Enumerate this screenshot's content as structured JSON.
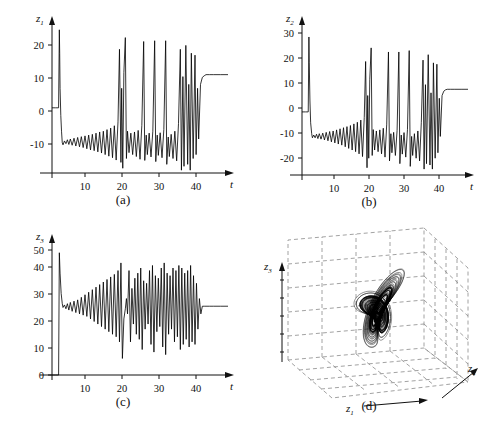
{
  "figure": {
    "background": "#ffffff",
    "line_color": "#000000",
    "grid_color": "#888888",
    "panels": [
      {
        "id": "a",
        "caption": "(a)"
      },
      {
        "id": "b",
        "caption": "(b)"
      },
      {
        "id": "c",
        "caption": "(c)"
      },
      {
        "id": "d",
        "caption": "(d)"
      }
    ]
  },
  "chart_data": [
    {
      "type": "line",
      "panel": "a",
      "title": "",
      "xlabel": "t",
      "ylabel": "z1",
      "ylabel_base": "z",
      "ylabel_sub": "1",
      "xlim": [
        0,
        48
      ],
      "ylim": [
        -18,
        22
      ],
      "xticks": [
        10,
        20,
        30,
        40
      ],
      "yticks": [
        -10,
        0,
        10,
        20
      ],
      "xtick_labels": [
        "10",
        "20",
        "30",
        "40"
      ],
      "ytick_labels": [
        "-10",
        "0",
        "10",
        "20"
      ],
      "grid": false,
      "steady_state": 8.5,
      "initial_spike": 20,
      "description": "Chaotic transient of z1 settling to fixed point 8.5 near t=42",
      "series": [
        {
          "name": "z1",
          "x": [
            0,
            1.0,
            1.8,
            2.0,
            2.1,
            2.2,
            2.4,
            2.6,
            2.8,
            3.0,
            3.4,
            3.8,
            4.2,
            4.6,
            5.0,
            5.5,
            6.0,
            6.5,
            7.0,
            7.5,
            8.0,
            8.5,
            9.0,
            9.5,
            10.0,
            10.5,
            11.0,
            11.5,
            12.0,
            12.5,
            13.0,
            13.5,
            14.0,
            14.5,
            15.0,
            15.5,
            16.0,
            16.5,
            17.0,
            17.5,
            18.0,
            18.4,
            18.8,
            19.0,
            19.3,
            19.6,
            20.0,
            20.3,
            20.6,
            21.0,
            21.5,
            22.0,
            22.5,
            23.0,
            23.5,
            24.0,
            24.5,
            25.0,
            25.3,
            25.7,
            26.0,
            26.5,
            27.0,
            27.5,
            28.0,
            28.3,
            28.7,
            29.0,
            29.5,
            30.0,
            30.5,
            31.0,
            31.3,
            31.7,
            32.0,
            32.5,
            33.0,
            33.5,
            34.0,
            34.5,
            35.0,
            35.3,
            35.7,
            36.0,
            36.5,
            37.0,
            37.3,
            37.7,
            38.0,
            38.5,
            39.0,
            39.3,
            39.7,
            40.0,
            40.5,
            41.0,
            41.5,
            42.0,
            43.0,
            44.0,
            46.0,
            48.0
          ],
          "y": [
            0,
            0,
            0,
            20,
            14,
            5,
            -2,
            -6,
            -9,
            -9.5,
            -8.5,
            -9.2,
            -8.2,
            -9.4,
            -8.0,
            -9.6,
            -7.8,
            -9.8,
            -7.6,
            -10.0,
            -7.4,
            -10.2,
            -7.2,
            -10.5,
            -7.0,
            -10.8,
            -6.8,
            -11.0,
            -6.5,
            -11.3,
            -6.2,
            -11.6,
            -6.0,
            -12.0,
            -5.6,
            -12.4,
            -5.2,
            -12.8,
            -4.6,
            -13.4,
            -3.6,
            15.0,
            -14.0,
            5.0,
            -15.5,
            9.0,
            18.0,
            -13.0,
            -6.0,
            -11.5,
            -6.5,
            -12.0,
            -6.2,
            -12.5,
            -5.8,
            -13.2,
            -4.5,
            17.0,
            -13.5,
            -7.0,
            -12.0,
            -6.5,
            -12.6,
            -6.0,
            17.2,
            -13.8,
            -7.0,
            -12.2,
            -6.4,
            -12.8,
            -5.6,
            17.2,
            -14.5,
            -7.5,
            -12.5,
            -6.8,
            -13.0,
            -6.0,
            -13.6,
            -4.0,
            15.0,
            -16.0,
            8.0,
            -15.0,
            16.0,
            -14.5,
            6.0,
            -16.0,
            14.0,
            -13.0,
            13.5,
            -12.0,
            5.0,
            -8.0,
            6.0,
            7.8,
            8.2,
            8.5,
            8.5,
            8.5,
            8.5,
            8.5
          ]
        }
      ]
    },
    {
      "type": "line",
      "panel": "b",
      "title": "",
      "xlabel": "t",
      "ylabel": "z2",
      "ylabel_base": "z",
      "ylabel_sub": "2",
      "xlim": [
        0,
        48
      ],
      "ylim": [
        -25,
        33
      ],
      "xticks": [
        10,
        20,
        30,
        40
      ],
      "yticks": [
        -20,
        -10,
        0,
        10,
        20,
        30
      ],
      "xtick_labels": [
        "-20",
        "-10",
        "0",
        "10",
        "20",
        "30"
      ],
      "ytick_labels": [
        "-20",
        "-10",
        "0",
        "10",
        "20",
        "30"
      ],
      "grid": false,
      "steady_state": 8.3,
      "initial_spike": 27.5,
      "description": "Chaotic transient of z2 settling to fixed point 8.3 near t=42",
      "series": [
        {
          "name": "z2",
          "x": [
            0,
            1.0,
            1.8,
            2.0,
            2.1,
            2.3,
            2.5,
            2.8,
            3.0,
            3.4,
            3.8,
            4.2,
            4.6,
            5.0,
            5.5,
            6.0,
            6.5,
            7.0,
            7.5,
            8.0,
            8.5,
            9.0,
            9.5,
            10.0,
            10.5,
            11.0,
            11.5,
            12.0,
            12.5,
            13.0,
            13.5,
            14.0,
            14.5,
            15.0,
            15.5,
            16.0,
            16.5,
            17.0,
            17.5,
            18.0,
            18.4,
            18.8,
            19.0,
            19.3,
            19.6,
            20.0,
            20.3,
            20.6,
            21.0,
            21.5,
            22.0,
            22.5,
            23.0,
            23.5,
            24.0,
            24.5,
            25.0,
            25.3,
            25.7,
            26.0,
            26.5,
            27.0,
            27.5,
            28.0,
            28.3,
            28.7,
            29.0,
            29.5,
            30.0,
            30.5,
            31.0,
            31.3,
            31.7,
            32.0,
            32.5,
            33.0,
            33.5,
            34.0,
            34.5,
            35.0,
            35.3,
            35.7,
            36.0,
            36.5,
            37.0,
            37.3,
            37.7,
            38.0,
            38.5,
            39.0,
            39.3,
            39.7,
            40.0,
            40.5,
            41.0,
            41.5,
            42.0,
            43.0,
            44.0,
            46.0,
            48.0
          ],
          "y": [
            0,
            0,
            0,
            27.5,
            18,
            4,
            -4,
            -8,
            -9.5,
            -8.5,
            -9.5,
            -8.2,
            -9.8,
            -8.0,
            -10.0,
            -7.8,
            -10.3,
            -7.5,
            -10.6,
            -7.2,
            -11.0,
            -7.0,
            -11.4,
            -6.6,
            -11.8,
            -6.2,
            -12.2,
            -5.8,
            -12.8,
            -5.4,
            -13.4,
            -5.0,
            -14.0,
            -4.4,
            -14.6,
            -3.8,
            -15.4,
            -3.0,
            -16.4,
            -2.0,
            18.5,
            -20.5,
            6.0,
            -17.0,
            12.0,
            23.5,
            -16.0,
            -6.5,
            -14.0,
            -7.0,
            -14.6,
            -6.6,
            -15.4,
            -6.0,
            -16.6,
            -4.5,
            22.0,
            -18.0,
            -8.0,
            -15.0,
            -7.5,
            -16.0,
            -6.8,
            22.0,
            -19.0,
            -8.5,
            -15.5,
            -7.6,
            -16.6,
            -6.4,
            22.5,
            -20.0,
            -9.0,
            -16.0,
            -8.0,
            -17.0,
            -7.0,
            -18.0,
            -4.0,
            19.0,
            -21.0,
            10.0,
            -19.0,
            21.0,
            -19.5,
            7.0,
            -21.0,
            18.0,
            -17.0,
            17.5,
            -15.0,
            5.0,
            -9.0,
            6.0,
            7.6,
            8.1,
            8.3,
            8.3,
            8.3,
            8.3,
            8.3
          ]
        }
      ]
    },
    {
      "type": "line",
      "panel": "c",
      "title": "",
      "xlabel": "t",
      "ylabel": "z3",
      "ylabel_base": "z",
      "ylabel_sub": "3",
      "xlim": [
        0,
        48
      ],
      "ylim": [
        0,
        53
      ],
      "xticks": [
        10,
        20,
        30,
        40
      ],
      "yticks": [
        0,
        10,
        20,
        30,
        40,
        50
      ],
      "xtick_labels": [
        "10",
        "20",
        "30",
        "40"
      ],
      "ytick_labels": [
        "0",
        "10",
        "20",
        "30",
        "40",
        "50"
      ],
      "grid": false,
      "steady_state": 27,
      "initial_spike": 48,
      "description": "Chaotic transient of z3 oscillating about 27, settling to fixed point 27 near t=41",
      "series": [
        {
          "name": "z3",
          "x": [
            0,
            1.0,
            1.8,
            2.0,
            2.2,
            2.5,
            2.8,
            3.0,
            3.4,
            3.8,
            4.2,
            4.6,
            5.0,
            5.5,
            6.0,
            6.5,
            7.0,
            7.5,
            8.0,
            8.5,
            9.0,
            9.5,
            10.0,
            10.5,
            11.0,
            11.5,
            12.0,
            12.5,
            13.0,
            13.5,
            14.0,
            14.5,
            15.0,
            15.5,
            16.0,
            16.5,
            17.0,
            17.5,
            18.0,
            18.4,
            18.8,
            19.2,
            19.6,
            20.0,
            20.3,
            20.6,
            21.0,
            21.4,
            21.8,
            22.2,
            22.6,
            23.0,
            23.4,
            23.8,
            24.2,
            24.6,
            25.0,
            25.4,
            25.8,
            26.2,
            26.6,
            27.0,
            27.4,
            27.8,
            28.2,
            28.6,
            29.0,
            29.4,
            29.8,
            30.2,
            30.6,
            31.0,
            31.4,
            31.8,
            32.2,
            32.6,
            33.0,
            33.4,
            33.8,
            34.2,
            34.6,
            35.0,
            35.4,
            35.8,
            36.2,
            36.6,
            37.0,
            37.4,
            37.8,
            38.2,
            38.6,
            39.0,
            39.4,
            39.8,
            40.2,
            40.6,
            41.0,
            41.5,
            42.0,
            43.0,
            44.0,
            46.0,
            48.0
          ],
          "y": [
            0,
            0,
            0,
            48,
            40,
            32,
            28,
            26.5,
            27.5,
            26,
            28,
            25.5,
            28.5,
            25,
            29,
            24.5,
            29.5,
            24,
            30.5,
            23.5,
            31.5,
            23,
            32.5,
            22,
            33.5,
            21,
            34.5,
            20,
            35.5,
            19,
            36.5,
            18,
            37.5,
            17,
            38.5,
            16,
            39.5,
            15,
            41,
            13,
            44,
            6.5,
            22,
            26,
            30,
            24,
            41,
            13,
            34,
            20,
            38,
            16,
            40,
            14,
            42,
            10,
            37,
            18,
            36,
            20,
            41,
            12,
            43,
            9,
            39,
            17,
            38,
            19,
            42,
            11,
            44,
            8,
            40,
            16,
            39,
            18,
            42,
            13,
            41,
            15,
            43,
            10,
            42,
            12,
            40,
            14,
            41,
            11,
            43,
            13,
            39,
            12,
            36,
            18,
            30,
            24,
            27,
            27,
            27,
            27,
            27,
            27,
            27
          ]
        }
      ]
    },
    {
      "type": "scatter",
      "panel": "d",
      "title": "",
      "xlabel": "z1",
      "ylabel": "z2",
      "zlabel": "z3",
      "projection": "3d",
      "grid": true,
      "grid_style": "dashed",
      "description": "Three-dimensional phase portrait of the Lorenz attractor: two-lobed butterfly orbit in (z1, z2, z3) space, drawn inside a dashed box grid.",
      "axis_labels": {
        "x": {
          "base": "z",
          "sub": "1"
        },
        "y": {
          "base": "z",
          "sub": "2"
        },
        "z": {
          "base": "z",
          "sub": "3"
        }
      }
    }
  ]
}
